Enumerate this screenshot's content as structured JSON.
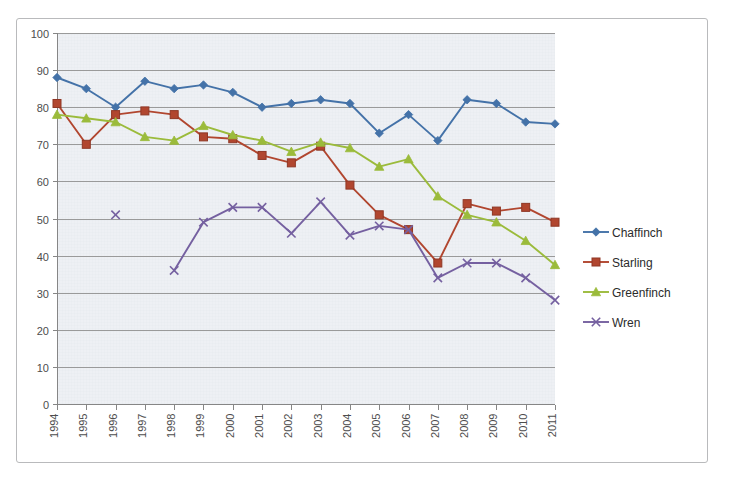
{
  "chart_data": {
    "type": "line",
    "title": "",
    "subtitle": "",
    "xlabel": "",
    "ylabel": "",
    "categories": [
      "1994",
      "1995",
      "1996",
      "1997",
      "1998",
      "1999",
      "2000",
      "2001",
      "2002",
      "2003",
      "2004",
      "2005",
      "2006",
      "2007",
      "2008",
      "2009",
      "2010",
      "2011"
    ],
    "ylim": [
      0,
      100
    ],
    "yticks": [
      0,
      10,
      20,
      30,
      40,
      50,
      60,
      70,
      80,
      90,
      100
    ],
    "grid": "horizontal",
    "legend_position": "right",
    "xtick_rotation": -90,
    "series": [
      {
        "name": "Chaffinch",
        "color": "#4472a8",
        "marker": "diamond",
        "values": [
          88,
          85,
          80,
          87,
          85,
          86,
          84,
          80,
          81,
          82,
          81,
          73,
          78,
          71,
          82,
          81,
          76,
          75.5
        ]
      },
      {
        "name": "Starling",
        "color": "#b1462f",
        "marker": "square",
        "values": [
          81,
          70,
          78,
          79,
          78,
          72,
          71.5,
          67,
          65,
          69.5,
          59,
          51,
          47,
          38,
          54,
          52,
          53,
          49
        ]
      },
      {
        "name": "Greenfinch",
        "color": "#9bbb3b",
        "marker": "triangle",
        "values": [
          78,
          77,
          76,
          72,
          71,
          75,
          72.5,
          71,
          68,
          70.5,
          69,
          64,
          66,
          56,
          51,
          49,
          44,
          37.5
        ]
      },
      {
        "name": "Wren",
        "color": "#7560a0",
        "marker": "cross",
        "values": [
          null,
          null,
          51,
          null,
          36,
          49,
          53,
          53,
          46,
          54.5,
          45.5,
          48,
          47,
          34,
          38,
          38,
          34,
          28
        ]
      }
    ]
  },
  "legend": {
    "items": [
      {
        "label": "Chaffinch"
      },
      {
        "label": "Starling"
      },
      {
        "label": "Greenfinch"
      },
      {
        "label": "Wren"
      }
    ]
  },
  "colors": {
    "plot_background": "#eef0f4",
    "frame_border": "#b9babc",
    "gridline": "#9a9a9a",
    "axis": "#868686",
    "tick_label": "#4d4d4d"
  }
}
